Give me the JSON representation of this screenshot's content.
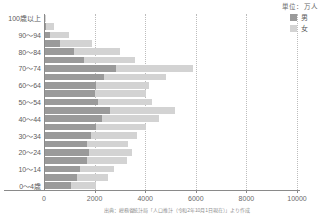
{
  "legend": {
    "unit": "単位：万人",
    "items": [
      {
        "label": "男",
        "color": "#9a9a9a",
        "icon": "square-swatch-male"
      },
      {
        "label": "女",
        "color": "#d3d3d3",
        "icon": "square-swatch-female"
      }
    ]
  },
  "source": {
    "note": "出典：総務省統計局「人口推計（令和2年10月1日現在）」より作成"
  },
  "chart_data": {
    "type": "bar",
    "orientation": "horizontal",
    "stacked": true,
    "title": "",
    "subtitle": "",
    "xlabel": "",
    "ylabel": "",
    "unit": "万人",
    "xlim": [
      0,
      10000
    ],
    "xticks": [
      0,
      2000,
      4000,
      6000,
      8000,
      10000
    ],
    "xtick_labels": [
      "0",
      "2000",
      "4000",
      "6000",
      "8000",
      "10000"
    ],
    "grid": true,
    "grid_axis": "x",
    "legend_position": "top-right",
    "categories": [
      "100歳以上",
      "95～99",
      "90～94",
      "85～89",
      "80～84",
      "75～79",
      "70～74",
      "65～69",
      "60～64",
      "55～59",
      "50～54",
      "45～49",
      "40～44",
      "35～39",
      "30～34",
      "25～29",
      "20～24",
      "15～19",
      "10～14",
      "5～9",
      "0～4歳"
    ],
    "ytick_labels": [
      "100歳以上",
      "",
      "90～94",
      "",
      "80～84",
      "",
      "70～74",
      "",
      "60～64",
      "",
      "50～54",
      "",
      "40～44",
      "",
      "30～34",
      "",
      "20～24",
      "",
      "10～14",
      "",
      "0～4歳"
    ],
    "series": [
      {
        "name": "男",
        "color": "#9a9a9a",
        "values": [
          15,
          90,
          250,
          640,
          1180,
          1600,
          2840,
          2370,
          2050,
          2010,
          2130,
          2600,
          2310,
          2050,
          1870,
          1700,
          1780,
          1680,
          1420,
          1300,
          1060
        ]
      },
      {
        "name": "女",
        "color": "#d3d3d3",
        "values": [
          65,
          310,
          720,
          1250,
          1810,
          2000,
          3030,
          2470,
          2110,
          2040,
          2150,
          2560,
          2250,
          1970,
          1790,
          1610,
          1680,
          1600,
          1350,
          1240,
          1000
        ]
      }
    ],
    "totals": [
      80,
      400,
      970,
      1890,
      2990,
      3600,
      5870,
      4840,
      4160,
      4050,
      4280,
      5160,
      4560,
      4020,
      3660,
      3310,
      3460,
      3280,
      2770,
      2540,
      2060
    ]
  }
}
